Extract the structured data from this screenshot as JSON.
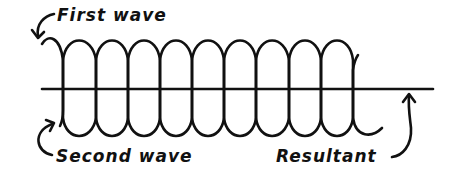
{
  "labels": {
    "first_wave": "First wave",
    "second_wave": "Second wave",
    "resultant": "Resultant"
  },
  "colors": {
    "ink": "#111111",
    "background": "#ffffff"
  }
}
